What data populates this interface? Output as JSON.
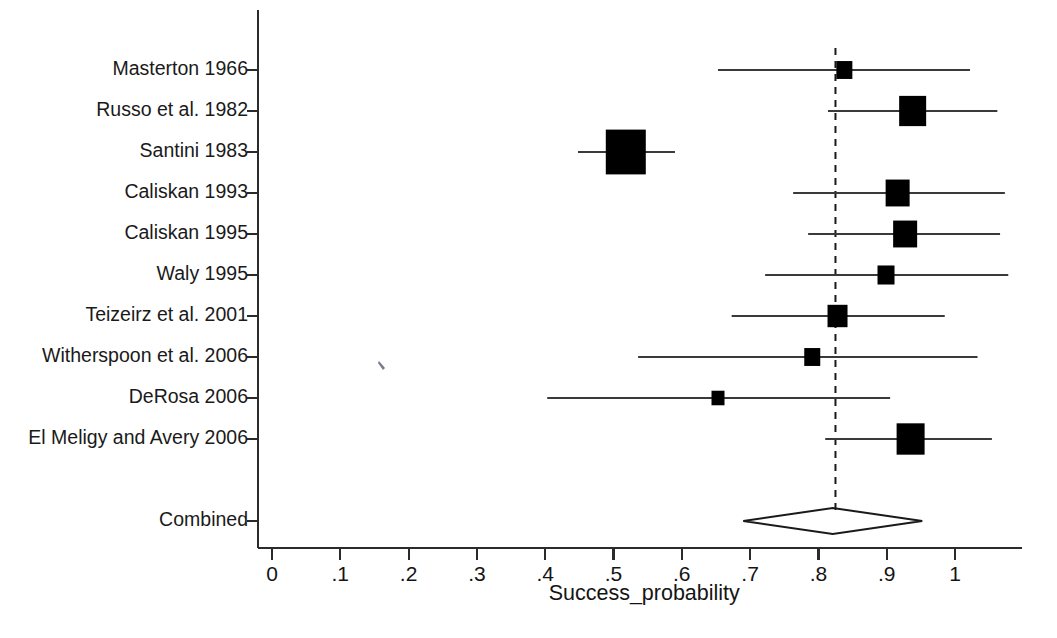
{
  "chart_data": {
    "type": "scatter",
    "subtype": "forest-plot",
    "title": "",
    "xlabel": "Success_probability",
    "ylabel": "",
    "xlim": [
      0,
      1.09
    ],
    "xticks": [
      0,
      0.1,
      0.2,
      0.3,
      0.4,
      0.5,
      0.6,
      0.7,
      0.8,
      0.9,
      1
    ],
    "xtick_labels": [
      "0",
      ".1",
      ".2",
      ".3",
      ".4",
      ".5",
      ".6",
      ".7",
      ".8",
      ".9",
      "1"
    ],
    "grid": false,
    "legend": null,
    "reference_line": {
      "name": "combined-effect-line",
      "value": 0.825,
      "style": "dashed"
    },
    "categories": [
      "Masterton 1966",
      "Russo et al. 1982",
      "Santini 1983",
      "Caliskan 1993",
      "Caliskan 1995",
      "Waly 1995",
      "Teizeirz et al. 2001",
      "Witherspoon et al. 2006",
      "DeRosa 2006",
      "El Meligy and Avery 2006",
      "Combined"
    ],
    "studies": [
      {
        "label": "Masterton 1966",
        "estimate": 0.838,
        "ci_low": 0.653,
        "ci_high": 1.022,
        "marker_size": 16
      },
      {
        "label": "Russo et al. 1982",
        "estimate": 0.938,
        "ci_low": 0.814,
        "ci_high": 1.062,
        "marker_size": 27
      },
      {
        "label": "Santini 1983",
        "estimate": 0.518,
        "ci_low": 0.448,
        "ci_high": 0.59,
        "marker_size": 40
      },
      {
        "label": "Caliskan 1993",
        "estimate": 0.916,
        "ci_low": 0.763,
        "ci_high": 1.073,
        "marker_size": 24
      },
      {
        "label": "Caliskan 1995",
        "estimate": 0.927,
        "ci_low": 0.785,
        "ci_high": 1.066,
        "marker_size": 24
      },
      {
        "label": "Waly 1995",
        "estimate": 0.899,
        "ci_low": 0.722,
        "ci_high": 1.078,
        "marker_size": 17
      },
      {
        "label": "Teizeirz et al. 2001",
        "estimate": 0.828,
        "ci_low": 0.673,
        "ci_high": 0.985,
        "marker_size": 20
      },
      {
        "label": "Witherspoon et al. 2006",
        "estimate": 0.791,
        "ci_low": 0.536,
        "ci_high": 1.033,
        "marker_size": 16
      },
      {
        "label": "DeRosa 2006",
        "estimate": 0.653,
        "ci_low": 0.403,
        "ci_high": 0.905,
        "marker_size": 13
      },
      {
        "label": "El Meligy and Avery 2006",
        "estimate": 0.935,
        "ci_low": 0.81,
        "ci_high": 1.054,
        "marker_size": 28
      }
    ],
    "combined": {
      "label": "Combined",
      "estimate": 0.821,
      "ci_low": 0.69,
      "ci_high": 0.952
    }
  },
  "colors": {
    "marker": "#000000",
    "line": "#3a3a3a",
    "axis": "#2b2b2b",
    "text": "#1a1a1a",
    "background": "#ffffff"
  }
}
